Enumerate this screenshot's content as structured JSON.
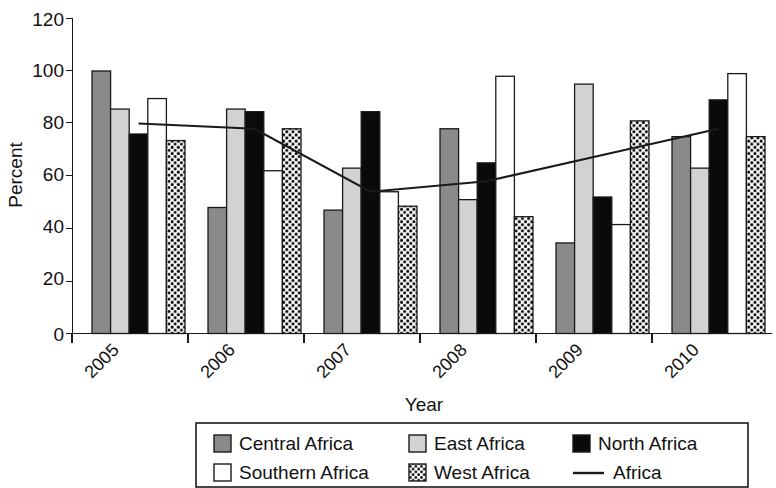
{
  "chart_data": {
    "type": "bar",
    "title": "",
    "subtitle": "",
    "xlabel": "Year",
    "ylabel": "Percent",
    "categories": [
      "2005",
      "2006",
      "2007",
      "2008",
      "2009",
      "2010"
    ],
    "ylim": [
      0,
      120
    ],
    "yticks": [
      0,
      20,
      40,
      60,
      80,
      100,
      120
    ],
    "ytick_labels": [
      "0",
      "20",
      "40",
      "60",
      "80",
      "100",
      "120"
    ],
    "grid": false,
    "legend_position": "bottom",
    "series": [
      {
        "name": "Central Africa",
        "type": "bar",
        "fill": "dark-gray-solid",
        "color": "#878787",
        "values": [
          100,
          48,
          47,
          78,
          34.5,
          75
        ]
      },
      {
        "name": "East Africa",
        "type": "bar",
        "fill": "light-gray-solid",
        "color": "#cccccc",
        "values": [
          85.5,
          85.5,
          63,
          51,
          95,
          63
        ]
      },
      {
        "name": "North Africa",
        "type": "bar",
        "fill": "black-solid",
        "color": "#000000",
        "values": [
          76,
          84.5,
          84.5,
          65,
          52,
          89
        ]
      },
      {
        "name": "Southern Africa",
        "type": "bar",
        "fill": "white-solid",
        "color": "#ffffff",
        "values": [
          89.5,
          62,
          54,
          98,
          41.5,
          99
        ]
      },
      {
        "name": "West Africa",
        "type": "bar",
        "fill": "checkered-dots",
        "color": "#ffffff",
        "values": [
          73.5,
          78,
          48.5,
          44.5,
          81,
          75
        ]
      },
      {
        "name": "Africa",
        "type": "line",
        "fill": "solid-line",
        "color": "#1a1a1a",
        "values": [
          80,
          78,
          54,
          58,
          68,
          78
        ]
      }
    ]
  },
  "legend": {
    "row1": [
      {
        "label": "Central Africa",
        "swatch": "dark-gray-solid"
      },
      {
        "label": "East Africa",
        "swatch": "light-gray-solid"
      },
      {
        "label": "North Africa",
        "swatch": "black-solid"
      }
    ],
    "row2": [
      {
        "label": "Southern Africa",
        "swatch": "white-solid"
      },
      {
        "label": "West Africa",
        "swatch": "checkered-dots"
      },
      {
        "label": "Africa",
        "swatch": "solid-line"
      }
    ]
  }
}
